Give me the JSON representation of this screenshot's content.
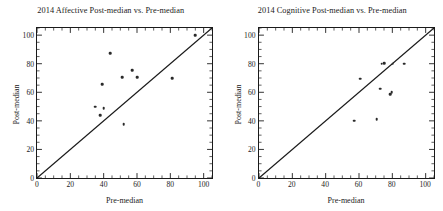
{
  "figure": {
    "background": "#ffffff",
    "marker_color": "#2a2a2a",
    "axis_color": "#1a1a1a"
  },
  "panels": [
    {
      "id": "affective",
      "title": "2014 Affective Post-median vs. Pre-median",
      "xlabel": "Pre-median",
      "ylabel": "Post-median"
    },
    {
      "id": "cognitive",
      "title": "2014 Cognitive Post-median vs. Pre-median",
      "xlabel": "Pre-median",
      "ylabel": "Post-median"
    }
  ],
  "chart_data": [
    {
      "type": "scatter",
      "title": "2014 Affective Post-median vs. Pre-median",
      "xlabel": "Pre-median",
      "ylabel": "Post-median",
      "xlim": [
        0,
        105
      ],
      "ylim": [
        0,
        105
      ],
      "xticks": [
        0,
        20,
        40,
        60,
        80,
        100
      ],
      "yticks": [
        0,
        20,
        40,
        60,
        80,
        100
      ],
      "xtick_labels": [
        "0",
        "20",
        "40",
        "60",
        "80",
        "100"
      ],
      "ytick_labels": [
        "0",
        "20",
        "40",
        "60",
        "80",
        "100"
      ],
      "grid": false,
      "legend": null,
      "reference_line": {
        "type": "identity",
        "label": "y = x",
        "from": [
          0,
          0
        ],
        "to": [
          105,
          105
        ]
      },
      "points": [
        {
          "x": 35,
          "y": 50
        },
        {
          "x": 38,
          "y": 44
        },
        {
          "x": 39,
          "y": 65.5
        },
        {
          "x": 40,
          "y": 49
        },
        {
          "x": 44,
          "y": 87.5
        },
        {
          "x": 51,
          "y": 70.5
        },
        {
          "x": 52,
          "y": 37.5
        },
        {
          "x": 57,
          "y": 75.5
        },
        {
          "x": 60,
          "y": 70.5
        },
        {
          "x": 81,
          "y": 70
        },
        {
          "x": 95,
          "y": 100
        }
      ]
    },
    {
      "type": "scatter",
      "title": "2014 Cognitive Post-median vs. Pre-median",
      "xlabel": "Pre-median",
      "ylabel": "Post-median",
      "xlim": [
        0,
        105
      ],
      "ylim": [
        0,
        105
      ],
      "xticks": [
        0,
        20,
        40,
        60,
        80,
        100
      ],
      "yticks": [
        0,
        20,
        40,
        60,
        80,
        100
      ],
      "xtick_labels": [
        "0",
        "20",
        "40",
        "60",
        "80",
        "100"
      ],
      "ytick_labels": [
        "0",
        "20",
        "40",
        "60",
        "80",
        "100"
      ],
      "grid": false,
      "legend": null,
      "reference_line": {
        "type": "identity",
        "label": "y = x",
        "from": [
          0,
          0
        ],
        "to": [
          105,
          105
        ]
      },
      "points": [
        {
          "x": 57.5,
          "y": 40
        },
        {
          "x": 61,
          "y": 69.5
        },
        {
          "x": 71,
          "y": 41
        },
        {
          "x": 73,
          "y": 62.5
        },
        {
          "x": 74,
          "y": 80
        },
        {
          "x": 75.5,
          "y": 80.5
        },
        {
          "x": 79,
          "y": 58.5
        },
        {
          "x": 80,
          "y": 60
        },
        {
          "x": 80.5,
          "y": 80
        },
        {
          "x": 87.5,
          "y": 80
        }
      ]
    }
  ]
}
